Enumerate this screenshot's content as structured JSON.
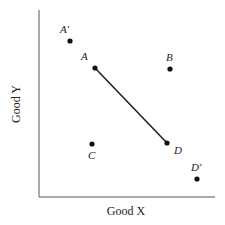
{
  "diagram": {
    "x_axis_label": "Good X",
    "y_axis_label": "Good Y",
    "points": [
      {
        "id": "A_prime",
        "label": "A′",
        "x": 70,
        "y": 41,
        "lx": 60,
        "ly": 33
      },
      {
        "id": "A",
        "label": "A",
        "x": 95,
        "y": 68,
        "lx": 81,
        "ly": 60
      },
      {
        "id": "B",
        "label": "B",
        "x": 170,
        "y": 69,
        "lx": 166,
        "ly": 61
      },
      {
        "id": "C",
        "label": "C",
        "x": 92,
        "y": 144,
        "lx": 88,
        "ly": 159
      },
      {
        "id": "D",
        "label": "D",
        "x": 167,
        "y": 143,
        "lx": 174,
        "ly": 154
      },
      {
        "id": "D_prime",
        "label": "D′",
        "x": 197,
        "y": 179,
        "lx": 191,
        "ly": 171
      }
    ],
    "segment": {
      "from": "A",
      "to": "D"
    },
    "line_color": "#222222"
  }
}
